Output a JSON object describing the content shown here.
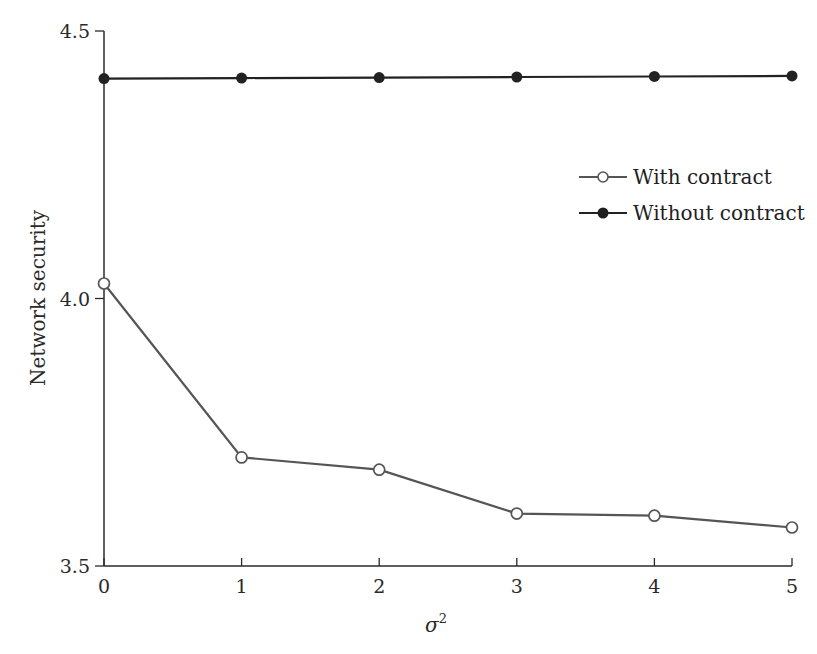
{
  "chart_data": {
    "type": "line",
    "title": "",
    "xlabel": "σ",
    "xlabel_superscript": "2",
    "ylabel": "Network security",
    "x": [
      0,
      1,
      2,
      3,
      4,
      5
    ],
    "x_ticks": [
      "0",
      "1",
      "2",
      "3",
      "4",
      "5"
    ],
    "y_ticks": [
      "3.5",
      "4.0",
      "4.5"
    ],
    "ylim": [
      3.5,
      4.5
    ],
    "xlim": [
      0,
      5
    ],
    "grid": false,
    "legend_position": "upper right (inside plot, mid-height)",
    "series": [
      {
        "name": "With contract",
        "marker": "open-circle",
        "color": "#555555",
        "values": [
          4.028,
          3.703,
          3.68,
          3.598,
          3.594,
          3.572
        ]
      },
      {
        "name": "Without contract",
        "marker": "filled-circle",
        "color": "#222222",
        "values": [
          4.411,
          4.412,
          4.413,
          4.414,
          4.415,
          4.416
        ]
      }
    ]
  },
  "legend": {
    "items": [
      {
        "label": "With contract"
      },
      {
        "label": "Without contract"
      }
    ]
  }
}
